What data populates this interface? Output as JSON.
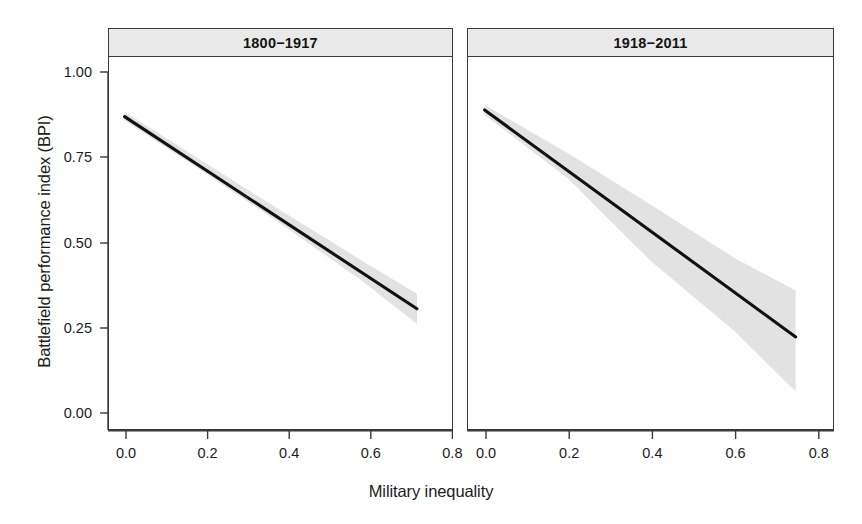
{
  "chart_data": {
    "type": "line",
    "title": "",
    "xlabel": "Military inequality",
    "ylabel": "Battlefield performance index (BPI)",
    "xlim": [
      -0.04,
      0.84
    ],
    "ylim": [
      -0.06,
      1.06
    ],
    "xticks": [
      "0.0",
      "0.2",
      "0.4",
      "0.6",
      "0.8"
    ],
    "xtick_values": [
      0.0,
      0.2,
      0.4,
      0.6,
      0.8
    ],
    "yticks": [
      "0.00",
      "0.25",
      "0.50",
      "0.75",
      "1.00"
    ],
    "ytick_values": [
      0.0,
      0.25,
      0.5,
      0.75,
      1.0
    ],
    "grid": false,
    "legend": "none",
    "facets": [
      {
        "label": "1800−1917",
        "series": [
          {
            "name": "fitted BPI",
            "x": [
              0.0,
              0.75
            ],
            "values": [
              0.88,
              0.3
            ]
          }
        ],
        "confidence_band": {
          "x": [
            0.0,
            0.2,
            0.4,
            0.6,
            0.75
          ],
          "lower": [
            0.868,
            0.715,
            0.557,
            0.392,
            0.255
          ],
          "upper": [
            0.895,
            0.745,
            0.597,
            0.452,
            0.345
          ]
        }
      },
      {
        "label": "1918−2011",
        "series": [
          {
            "name": "fitted BPI",
            "x": [
              0.0,
              0.75
            ],
            "values": [
              0.9,
              0.215
            ]
          }
        ],
        "confidence_band": {
          "x": [
            0.0,
            0.2,
            0.4,
            0.6,
            0.75
          ],
          "lower": [
            0.885,
            0.695,
            0.445,
            0.235,
            0.05
          ],
          "upper": [
            0.915,
            0.77,
            0.615,
            0.455,
            0.355
          ]
        }
      }
    ]
  }
}
